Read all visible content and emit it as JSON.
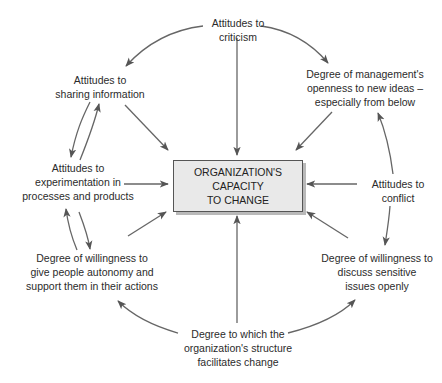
{
  "diagram": {
    "type": "influence-diagram",
    "center": {
      "lines": [
        "ORGANIZATION'S",
        "CAPACITY",
        "TO CHANGE"
      ]
    },
    "nodes": [
      {
        "id": "criticism",
        "lines": [
          "Attitudes to",
          "criticism"
        ]
      },
      {
        "id": "sharing",
        "lines": [
          "Attitudes to",
          "sharing information"
        ]
      },
      {
        "id": "management",
        "lines": [
          "Degree of management's",
          "openness to new ideas –",
          "especially from below"
        ]
      },
      {
        "id": "experimentation",
        "lines": [
          "Attitudes to",
          "experimentation in",
          "processes and products"
        ]
      },
      {
        "id": "conflict",
        "lines": [
          "Attitudes to",
          "conflict"
        ]
      },
      {
        "id": "autonomy",
        "lines": [
          "Degree of willingness to",
          "give people autonomy and",
          "support them in their actions"
        ]
      },
      {
        "id": "sensitive",
        "lines": [
          "Degree of willingness to",
          "discuss sensitive",
          "issues openly"
        ]
      },
      {
        "id": "structure",
        "lines": [
          "Degree to which the",
          "organization's structure",
          "facilitates change"
        ]
      }
    ],
    "edges": [
      {
        "from": "criticism",
        "to": "center"
      },
      {
        "from": "sharing",
        "to": "center"
      },
      {
        "from": "management",
        "to": "center"
      },
      {
        "from": "experimentation",
        "to": "center"
      },
      {
        "from": "conflict",
        "to": "center"
      },
      {
        "from": "autonomy",
        "to": "center"
      },
      {
        "from": "sensitive",
        "to": "center"
      },
      {
        "from": "structure",
        "to": "center"
      },
      {
        "from": "criticism",
        "to": "sharing"
      },
      {
        "from": "criticism",
        "to": "management"
      },
      {
        "from": "sharing",
        "to": "experimentation"
      },
      {
        "from": "experimentation",
        "to": "sharing"
      },
      {
        "from": "experimentation",
        "to": "autonomy"
      },
      {
        "from": "autonomy",
        "to": "experimentation"
      },
      {
        "from": "conflict",
        "to": "management"
      },
      {
        "from": "conflict",
        "to": "sensitive"
      },
      {
        "from": "structure",
        "to": "autonomy"
      },
      {
        "from": "structure",
        "to": "sensitive"
      }
    ],
    "colors": {
      "arrow": "#555555",
      "box_fill": "#e9e9e9",
      "box_shadow": "#b9b9b9",
      "text": "#2b2b2b"
    }
  }
}
